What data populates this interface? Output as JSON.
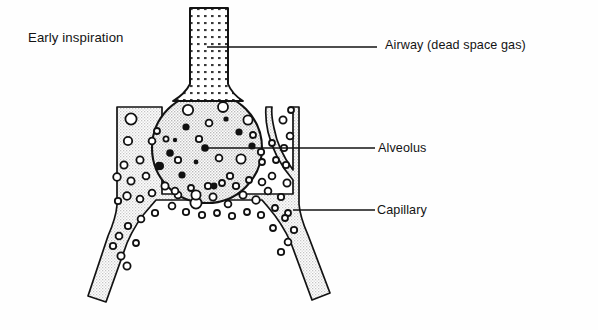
{
  "figure": {
    "title": "Early inspiration",
    "type": "anatomical-diagram",
    "ink_color": "#131313",
    "background_color": "#fefefe"
  },
  "labels": [
    {
      "id": "airway",
      "text": "Airway (dead space gas)"
    },
    {
      "id": "alveolus",
      "text": "Alveolus"
    },
    {
      "id": "capillary",
      "text": "Capillary"
    }
  ],
  "leader_lines": [
    {
      "id": "airway-leader",
      "from": [
        207,
        47
      ],
      "to": [
        377,
        47
      ]
    },
    {
      "id": "alveolus-leader",
      "from": [
        205,
        148
      ],
      "to": [
        375,
        148
      ]
    },
    {
      "id": "capillary-leader",
      "from": [
        293,
        210
      ],
      "to": [
        375,
        210
      ]
    }
  ],
  "structures": {
    "airway": {
      "name": "Airway",
      "fill_pattern": "coarse-square-dots",
      "fill_color": "#ffffff",
      "rect": {
        "x": 190,
        "y": 8,
        "width": 38,
        "height": 88
      }
    },
    "alveolus": {
      "name": "Alveolus",
      "fill_pattern": "fine-stipple",
      "fill_color": "#e3e3e3",
      "circle": {
        "cx": 207,
        "cy": 148,
        "r": 55
      }
    },
    "capillary": {
      "name": "Capillary",
      "fill_pattern": "fine-stipple",
      "fill_color": "#ededed",
      "shape": "inverted-u-channel"
    }
  },
  "particles": {
    "alveolar_gas_filled": {
      "meaning": "oxygen-molecules-filled-dots",
      "color": "#111111",
      "points": [
        [
          186,
          127,
          3.6
        ],
        [
          239,
          132,
          3.6
        ],
        [
          252,
          146,
          3.6
        ],
        [
          170,
          153,
          3.8
        ],
        [
          160,
          166,
          4.0
        ],
        [
          182,
          175,
          3.6
        ],
        [
          205,
          148,
          3.8
        ],
        [
          214,
          186,
          3.4
        ],
        [
          226,
          119,
          2.6
        ],
        [
          196,
          162,
          2.4
        ],
        [
          175,
          140,
          2.2
        ]
      ]
    },
    "alveolar_gas_open": {
      "meaning": "gas-molecules-open-circles",
      "color": "#111111",
      "points": [
        [
          188,
          110,
          5.2
        ],
        [
          223,
          107,
          5.0
        ],
        [
          248,
          120,
          4.6
        ],
        [
          209,
          123,
          3.4
        ],
        [
          166,
          139,
          2.6
        ],
        [
          157,
          131,
          3.0
        ],
        [
          199,
          139,
          3.2
        ],
        [
          178,
          160,
          3.2
        ],
        [
          219,
          158,
          3.4
        ],
        [
          241,
          159,
          4.6
        ],
        [
          262,
          162,
          3.0
        ],
        [
          230,
          176,
          3.2
        ],
        [
          196,
          195,
          4.6
        ],
        [
          253,
          135,
          3.0
        ],
        [
          175,
          191,
          3.4
        ]
      ]
    },
    "capillary_cells": {
      "meaning": "red-blood-cells-open-circles",
      "color": "#111111",
      "points": [
        [
          131,
          119,
          5.6
        ],
        [
          128,
          141,
          4.2
        ],
        [
          152,
          141,
          3.4
        ],
        [
          140,
          160,
          3.6
        ],
        [
          124,
          165,
          3.6
        ],
        [
          117,
          177,
          3.8
        ],
        [
          131,
          181,
          3.6
        ],
        [
          146,
          176,
          3.4
        ],
        [
          159,
          166,
          3.4
        ],
        [
          127,
          196,
          3.8
        ],
        [
          140,
          199,
          3.4
        ],
        [
          118,
          201,
          3.2
        ],
        [
          152,
          193,
          3.4
        ],
        [
          165,
          186,
          3.6
        ],
        [
          178,
          195,
          3.4
        ],
        [
          191,
          188,
          3.0
        ],
        [
          196,
          203,
          5.6
        ],
        [
          213,
          197,
          3.6
        ],
        [
          228,
          204,
          3.4
        ],
        [
          243,
          195,
          3.6
        ],
        [
          256,
          200,
          3.8
        ],
        [
          268,
          191,
          3.4
        ],
        [
          281,
          197,
          3.2
        ],
        [
          287,
          183,
          3.6
        ],
        [
          272,
          176,
          3.4
        ],
        [
          286,
          165,
          3.2
        ],
        [
          276,
          160,
          3.0
        ],
        [
          262,
          182,
          3.4
        ],
        [
          249,
          180,
          3.0
        ],
        [
          236,
          186,
          3.2
        ],
        [
          222,
          183,
          3.0
        ],
        [
          208,
          186,
          3.2
        ],
        [
          172,
          206,
          3.4
        ],
        [
          186,
          212,
          3.2
        ],
        [
          202,
          215,
          3.2
        ],
        [
          217,
          213,
          3.0
        ],
        [
          232,
          216,
          3.2
        ],
        [
          247,
          212,
          3.0
        ],
        [
          261,
          215,
          3.2
        ],
        [
          275,
          208,
          3.0
        ],
        [
          288,
          213,
          3.0
        ],
        [
          284,
          148,
          3.2
        ],
        [
          290,
          136,
          3.4
        ],
        [
          272,
          143,
          3.0
        ],
        [
          261,
          152,
          3.2
        ],
        [
          283,
          120,
          3.6
        ],
        [
          291,
          110,
          3.0
        ],
        [
          155,
          213,
          3.2
        ],
        [
          141,
          219,
          3.4
        ],
        [
          128,
          226,
          3.2
        ],
        [
          119,
          236,
          3.4
        ],
        [
          113,
          246,
          3.2
        ],
        [
          121,
          256,
          3.6
        ],
        [
          127,
          266,
          3.6
        ],
        [
          294,
          230,
          3.2
        ],
        [
          288,
          242,
          3.4
        ],
        [
          281,
          252,
          3.2
        ],
        [
          273,
          228,
          3.0
        ],
        [
          285,
          218,
          3.0
        ],
        [
          136,
          243,
          3.0
        ]
      ]
    }
  }
}
